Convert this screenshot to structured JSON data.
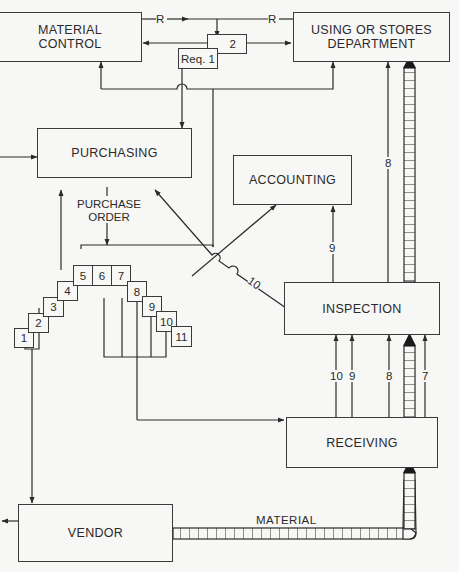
{
  "diagram": {
    "type": "procurement-document-flow",
    "nodes": {
      "material_control": "MATERIAL\nCONTROL",
      "using_stores": "USING OR STORES\nDEPARTMENT",
      "purchasing": "PURCHASING",
      "accounting": "ACCOUNTING",
      "inspection": "INSPECTION",
      "receiving": "RECEIVING",
      "vendor": "VENDOR"
    },
    "requisition": {
      "copy1": "Req. 1",
      "copy2": "2"
    },
    "purchase_order_label": "PURCHASE\nORDER",
    "po_copies": [
      "1",
      "2",
      "3",
      "4",
      "5",
      "6",
      "7",
      "8",
      "9",
      "10",
      "11"
    ],
    "edge_labels": {
      "r_left": "R",
      "r_right": "R",
      "to_using_8": "8",
      "to_accounting_9": "9",
      "to_purchasing_10": "10",
      "into_inspection": [
        "10",
        "9",
        "8",
        "7"
      ],
      "material": "MATERIAL"
    }
  }
}
